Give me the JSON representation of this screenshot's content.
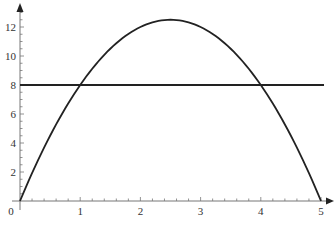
{
  "chart_data": {
    "type": "line",
    "title": "",
    "xlabel": "",
    "ylabel": "",
    "xlim": [
      0,
      5
    ],
    "ylim": [
      0,
      13
    ],
    "grid": false,
    "legend": null,
    "x_ticks": [
      0,
      1,
      2,
      3,
      4,
      5
    ],
    "x_tick_labels": [
      "0",
      "1",
      "2",
      "3",
      "4",
      "5"
    ],
    "x_minor_step": 0.2,
    "y_ticks": [
      2,
      4,
      6,
      8,
      10,
      12
    ],
    "y_tick_labels": [
      "2",
      "4",
      "6",
      "8",
      "10",
      "12"
    ],
    "y_minor_step": 0.5,
    "series": [
      {
        "name": "parabola",
        "formula": "y = 10x - 2x^2",
        "x": [
          0,
          0.5,
          1,
          1.5,
          2,
          2.5,
          3,
          3.5,
          4,
          4.5,
          5
        ],
        "y": [
          0,
          4.5,
          8,
          10.5,
          12,
          12.5,
          12,
          10.5,
          8,
          4.5,
          0
        ],
        "color": "#222222"
      },
      {
        "name": "horizontal-line",
        "formula": "y = 8",
        "x": [
          0,
          5.05
        ],
        "y": [
          8,
          8
        ],
        "color": "#222222"
      }
    ],
    "axis_color": "#777777"
  }
}
